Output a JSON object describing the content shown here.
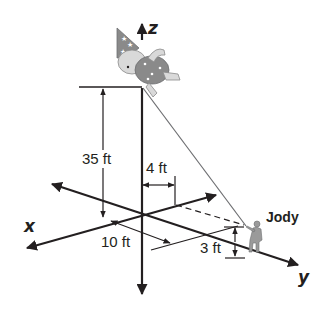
{
  "figure": {
    "axes": {
      "x_label": "x",
      "y_label": "y",
      "z_label": "z"
    },
    "dimensions": {
      "height": "35 ft",
      "offset_y": "4 ft",
      "offset_x": "10 ft",
      "jody_height": "3 ft"
    },
    "person_label": "Jody",
    "balloon": "clown-balloon",
    "colors": {
      "ink": "#231f20",
      "balloon_body": "#8a8a8a",
      "balloon_light": "#d9d9d9"
    }
  }
}
